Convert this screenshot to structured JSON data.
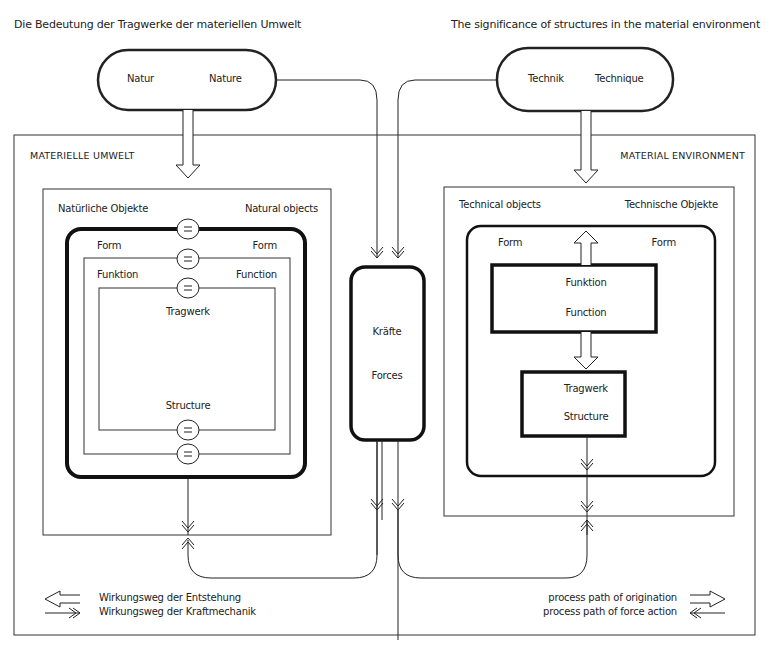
{
  "title_de": "Die Bedeutung der Tragwerke der materiellen Umwelt",
  "title_en": "The significance of structures in the material environment",
  "nature": {
    "de": "Natur",
    "en": "Nature"
  },
  "technique": {
    "de": "Technik",
    "en": "Technique"
  },
  "left_env_label": "MATERIELLE UMWELT",
  "right_env_label": "MATERIAL ENVIRONMENT",
  "natural_objects": {
    "de": "Natürliche Objekte",
    "en": "Natural objects",
    "form_de": "Form",
    "form_en": "Form",
    "function_de": "Funktion",
    "function_en": "Function",
    "structure_de": "Tragwerk",
    "structure_en": "Structure",
    "equals_symbol": "="
  },
  "forces": {
    "de": "Kräfte",
    "en": "Forces"
  },
  "technical_objects": {
    "en": "Technical objects",
    "de": "Technische Objekte",
    "form_left": "Form",
    "form_right": "Form",
    "function_de": "Funktion",
    "function_en": "Function",
    "structure_de": "Tragwerk",
    "structure_en": "Structure"
  },
  "legend_de": {
    "origination": "Wirkungsweg der Entstehung",
    "force_action": "Wirkungsweg der Kraftmechanik"
  },
  "legend_en": {
    "origination": "process path of origination",
    "force_action": "process path of force action"
  },
  "colors": {
    "ink": "#222222",
    "background": "#ffffff"
  }
}
